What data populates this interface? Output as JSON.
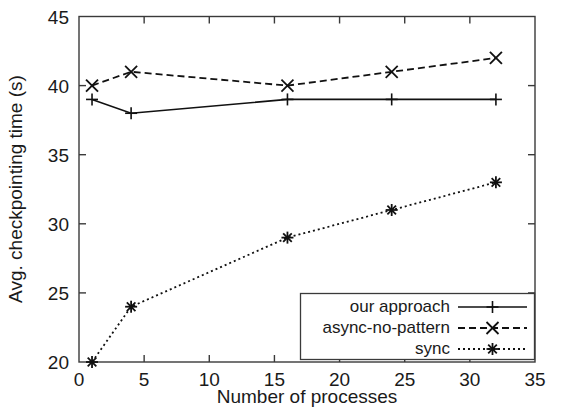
{
  "chart_data": {
    "type": "line",
    "title": "",
    "xlabel": "Number of processes",
    "ylabel": "Avg. checkpointing time (s)",
    "xlim": [
      0,
      35
    ],
    "ylim": [
      20,
      45
    ],
    "xticks": [
      0,
      5,
      10,
      15,
      20,
      25,
      30,
      35
    ],
    "yticks": [
      20,
      25,
      30,
      35,
      40,
      45
    ],
    "xtick_labels": [
      "0",
      "5",
      "10",
      "15",
      "20",
      "25",
      "30",
      "35"
    ],
    "ytick_labels": [
      "20",
      "25",
      "30",
      "35",
      "40",
      "45"
    ],
    "grid": false,
    "legend_position": "lower right",
    "x": [
      1,
      4,
      16,
      24,
      32
    ],
    "series": [
      {
        "name": "our approach",
        "values": [
          39,
          38,
          39,
          39,
          39
        ],
        "linestyle": "solid",
        "marker": "plus",
        "color": "#111111"
      },
      {
        "name": "async-no-pattern",
        "values": [
          40,
          41,
          40,
          41,
          42
        ],
        "linestyle": "dashed",
        "marker": "cross",
        "color": "#111111"
      },
      {
        "name": "sync",
        "values": [
          20,
          24,
          29,
          31,
          33
        ],
        "linestyle": "dotted",
        "marker": "star",
        "color": "#111111"
      }
    ]
  },
  "legend": {
    "items": [
      {
        "label": "our approach"
      },
      {
        "label": "async-no-pattern"
      },
      {
        "label": "sync"
      }
    ]
  }
}
